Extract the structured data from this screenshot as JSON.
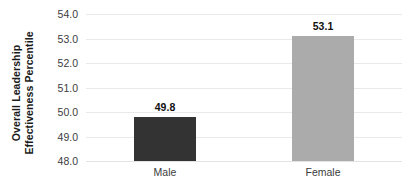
{
  "chart_data": {
    "type": "bar",
    "title": "",
    "subtitle": "",
    "xlabel": "",
    "ylabel": "Overall Leadership Effectiveness Percentile",
    "ylabel_lines": [
      "Overall Leadership",
      "Effectiveness Percentile"
    ],
    "categories": [
      "Male",
      "Female"
    ],
    "values": [
      49.8,
      53.1
    ],
    "value_labels": [
      "49.8",
      "53.1"
    ],
    "ylim": [
      48.0,
      54.0
    ],
    "ytick_step": 1.0,
    "yticks": [
      54.0,
      53.0,
      52.0,
      51.0,
      50.0,
      49.0,
      48.0
    ],
    "ytick_labels": [
      "54.0",
      "53.0",
      "52.0",
      "51.0",
      "50.0",
      "49.0",
      "48.0"
    ],
    "grid": "horizontal",
    "legend": "none",
    "bar_colors": [
      "#333333",
      "#ababab"
    ],
    "background": "#ffffff",
    "gridline_color": "#e9e9ea"
  }
}
